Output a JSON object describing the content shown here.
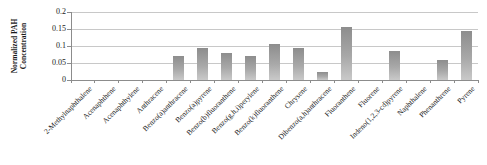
{
  "chart_data": {
    "type": "bar",
    "title": "",
    "ylabel": "Normalized PAH Concentration",
    "ylabel_lines": [
      "Normalized PAH",
      "Concentration"
    ],
    "xlabel": "",
    "categories": [
      "2-Methylnaphthalene",
      "Acenaphthene",
      "Acenaphthylene",
      "Anthracene",
      "Benzo(a)anthracene",
      "Benzo(a)pyrene",
      "Benzo(b)fluoranthene",
      "Benzo(g,h,i)perylene",
      "Benzo(k)fluoranthene",
      "Chrysene",
      "Dibenzo(a,h)anthracene",
      "Fluoranthene",
      "Fluorene",
      "Indeno(1,2,3-cd)pyrene",
      "Naphthalene",
      "Phenanthrene",
      "Pyrene"
    ],
    "values": [
      0,
      0,
      0,
      0,
      0.07,
      0.095,
      0.08,
      0.07,
      0.105,
      0.095,
      0.025,
      0.155,
      0,
      0.085,
      0,
      0.06,
      0.145
    ],
    "ylim": [
      0,
      0.2
    ],
    "yticks": [
      0,
      0.05,
      0.1,
      0.15,
      0.2
    ],
    "ytick_labels": [
      "0",
      "0.05",
      "0.1",
      "0.15",
      "0.2"
    ],
    "grid": true,
    "legend": "none",
    "colors": {
      "bar_top": "#8d8d8d",
      "bar_bottom": "#c9c9c9",
      "grid": "#c8c8c8",
      "axis": "#8c8c8c",
      "text": "#1a1a1a"
    }
  }
}
